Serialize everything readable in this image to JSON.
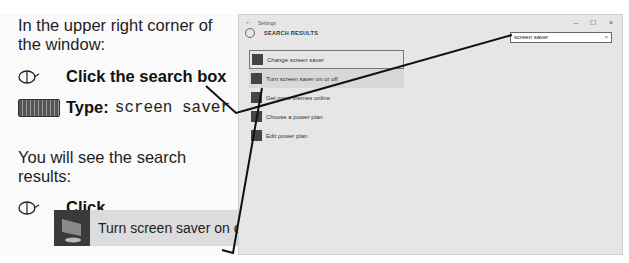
{
  "instructions": {
    "line1": "In the upper right corner of",
    "line2": "the window:",
    "step1": {
      "icon": "mouse-icon",
      "label": "Click the search box"
    },
    "step2": {
      "icon": "keyboard-icon",
      "label": "Type:",
      "value": "screen saver"
    },
    "line3": "You will see the search",
    "line4": "results:",
    "step3": {
      "icon": "mouse-icon",
      "label": "Click"
    },
    "callout": {
      "label": "Turn screen saver on o"
    }
  },
  "window": {
    "title": "Settings",
    "back": "←",
    "controls": {
      "minimize": "–",
      "maximize": "☐",
      "close": "×"
    },
    "header": "SEARCH RESULTS",
    "search": {
      "value": "screen saver",
      "clear": "×"
    },
    "results": [
      {
        "label": "Change screen saver"
      },
      {
        "label": "Turn screen saver on or off"
      },
      {
        "label": "Get more themes online"
      },
      {
        "label": "Choose a power plan"
      },
      {
        "label": "Edit power plan"
      }
    ]
  }
}
